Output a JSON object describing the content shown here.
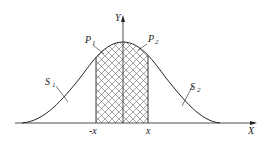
{
  "diagram": {
    "type": "normal-distribution-curve",
    "axes": {
      "x_label": "X",
      "y_label": "Y"
    },
    "ticks": {
      "left": "-x",
      "right": "x"
    },
    "regions": {
      "P1": {
        "label": "P",
        "sub": "1"
      },
      "P2": {
        "label": "P",
        "sub": "2"
      },
      "S1": {
        "label": "S",
        "sub": "1"
      },
      "S2": {
        "label": "S",
        "sub": "2"
      }
    },
    "colors": {
      "stroke": "#222222",
      "hatch": "#555555",
      "background": "#ffffff"
    }
  }
}
